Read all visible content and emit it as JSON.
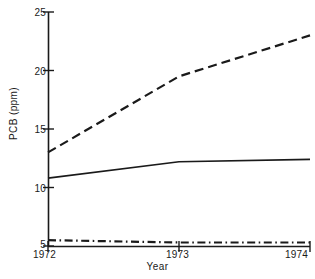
{
  "chart_data": {
    "type": "line",
    "title": "",
    "xlabel": "Year",
    "ylabel": "PCB (ppm)",
    "x": [
      1972,
      1973,
      1974
    ],
    "xtick_labels": [
      "1972",
      "1973",
      "1974"
    ],
    "ytick_labels": [
      "5",
      "10",
      "15",
      "20",
      "25"
    ],
    "ytick_values": [
      5,
      10,
      15,
      20,
      25
    ],
    "xlim": [
      1972,
      1974
    ],
    "ylim": [
      5,
      25
    ],
    "grid": false,
    "legend": "none",
    "series": [
      {
        "name": "dashed-series",
        "style": "dashed",
        "color": "#1a1a1a",
        "values": [
          13.0,
          19.5,
          23.0
        ]
      },
      {
        "name": "solid-series",
        "style": "solid",
        "color": "#1a1a1a",
        "values": [
          10.8,
          12.2,
          12.4
        ]
      },
      {
        "name": "dash-dot-series",
        "style": "dash-dot",
        "color": "#1a1a1a",
        "values": [
          5.5,
          5.3,
          5.3
        ]
      }
    ]
  },
  "axis": {
    "ylabel": "PCB (ppm)",
    "xlabel": "Year",
    "yticks": [
      "25",
      "20",
      "15",
      "10",
      "5"
    ],
    "xticks": [
      "1972",
      "1973",
      "1974"
    ]
  },
  "caption": {
    "cropped_text": ""
  }
}
